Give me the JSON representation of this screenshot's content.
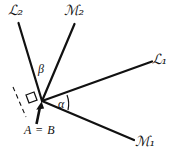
{
  "figure": {
    "background_color": "#ffffff",
    "stroke_color": "#111111",
    "width": 173,
    "height": 162
  },
  "labels": {
    "line_L2": {
      "letter": "L",
      "subscript": "2",
      "text": "ℒ₂"
    },
    "line_M2": {
      "letter": "M",
      "subscript": "2",
      "text": "ℳ₂"
    },
    "line_L1": {
      "letter": "L",
      "subscript": "1",
      "text": "ℒ₁"
    },
    "line_M1": {
      "letter": "M",
      "subscript": "1",
      "text": "ℳ₁"
    },
    "angle_alpha": "α",
    "angle_beta": "β",
    "vertex": "A = B"
  },
  "geometry": {
    "vertex": {
      "x": 42,
      "y": 101
    },
    "rays": [
      {
        "name": "L2",
        "from": {
          "x": 42,
          "y": 101
        },
        "to": {
          "x": 18,
          "y": 22
        }
      },
      {
        "name": "M2",
        "from": {
          "x": 42,
          "y": 101
        },
        "to": {
          "x": 75,
          "y": 23
        }
      },
      {
        "name": "L1",
        "from": {
          "x": 42,
          "y": 101
        },
        "to": {
          "x": 154,
          "y": 61
        }
      },
      {
        "name": "M1",
        "from": {
          "x": 42,
          "y": 101
        },
        "to": {
          "x": 136,
          "y": 141
        }
      }
    ],
    "dashed_line": {
      "from": {
        "x": 14,
        "y": 88
      },
      "to": {
        "x": 25,
        "y": 116
      }
    },
    "right_angle_marker": true,
    "pointer_arrow": {
      "from": {
        "x": 36,
        "y": 124
      },
      "to": {
        "x": 41,
        "y": 104
      }
    },
    "angle_arcs": [
      {
        "name": "alpha",
        "between": [
          "M1",
          "L1"
        ]
      },
      {
        "name": "beta",
        "between": [
          "L2",
          "M2"
        ]
      }
    ]
  }
}
